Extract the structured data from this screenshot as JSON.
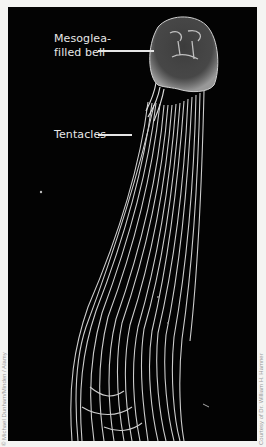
{
  "figure": {
    "background_color": "#030303",
    "labels": [
      {
        "line1": "Mesoglea-",
        "line2": "filled bell"
      },
      {
        "line1": "Tentacles"
      }
    ],
    "credits": {
      "left": "© Michael Dunham/Minden / Alamy",
      "right": "Courtesy of Dr. William H. Hamner"
    }
  }
}
